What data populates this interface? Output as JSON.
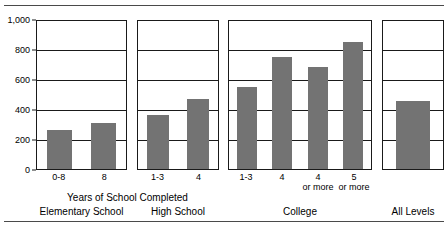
{
  "figure": {
    "clipped_top_caption": "",
    "yaxis": {
      "ticks": [
        "1,000",
        "800",
        "600",
        "400",
        "200",
        "0"
      ],
      "tick_values": [
        1000,
        800,
        600,
        400,
        200,
        0
      ]
    },
    "xaxis_title": "Years of School Completed",
    "groups": [
      {
        "caption": "Elementary School",
        "bars": [
          {
            "label": "0-8",
            "sub": "",
            "value": 262
          },
          {
            "label": "8",
            "sub": "",
            "value": 310
          }
        ]
      },
      {
        "caption": "High School",
        "bars": [
          {
            "label": "1-3",
            "sub": "",
            "value": 360
          },
          {
            "label": "4",
            "sub": "",
            "value": 468
          }
        ]
      },
      {
        "caption": "College",
        "bars": [
          {
            "label": "1-3",
            "sub": "",
            "value": 545
          },
          {
            "label": "4",
            "sub": "",
            "value": 745
          },
          {
            "label": "4",
            "sub": "or more",
            "value": 680
          },
          {
            "label": "5",
            "sub": "or more",
            "value": 845
          }
        ]
      },
      {
        "caption": "All Levels",
        "bars": [
          {
            "label": "",
            "sub": "",
            "value": 455
          }
        ]
      }
    ]
  },
  "chart_data": {
    "type": "bar",
    "title": "",
    "subtitle": "",
    "xlabel": "Years of School Completed",
    "ylabel": "",
    "ylim": [
      0,
      1000
    ],
    "yticks": [
      0,
      200,
      400,
      600,
      800,
      1000
    ],
    "ytick_labels": [
      "0",
      "200",
      "400",
      "600",
      "800",
      "1,000"
    ],
    "grid": true,
    "legend": "none",
    "bar_color": "#737373",
    "panels": [
      {
        "name": "Elementary School",
        "categories": [
          "0-8",
          "8"
        ],
        "values": [
          262,
          310
        ]
      },
      {
        "name": "High School",
        "categories": [
          "1-3",
          "4"
        ],
        "values": [
          360,
          468
        ]
      },
      {
        "name": "College",
        "categories": [
          "1-3",
          "4",
          "4 or more",
          "5 or more"
        ],
        "values": [
          545,
          745,
          680,
          845
        ]
      },
      {
        "name": "All Levels",
        "categories": [
          ""
        ],
        "values": [
          455
        ]
      }
    ],
    "categories": [
      "0-8",
      "8",
      "1-3",
      "4",
      "1-3",
      "4",
      "4 or more",
      "5 or more",
      "All Levels"
    ],
    "values": [
      262,
      310,
      360,
      468,
      545,
      745,
      680,
      845,
      455
    ]
  }
}
